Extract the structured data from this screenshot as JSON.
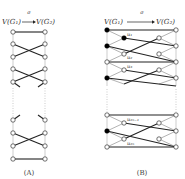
{
  "diagram_a": {
    "caption": "(A)",
    "map_label": "σ",
    "source_label": "V(G₁)",
    "target_label": "V(G₂)"
  },
  "diagram_b": {
    "caption": "(B)",
    "map_label": "σ",
    "source_label": "V(G₁)",
    "target_label": "V(G₂)",
    "edge_labels": [
      "u₁",
      "u₂",
      "u₃",
      "u₂ₙ₋₁",
      "u₂ₙ"
    ]
  },
  "colors": {
    "edge": "#222222",
    "thin_edge": "#777777",
    "node_fill_open": "#ffffff",
    "node_fill_filled": "#000000",
    "dotted": "#999999"
  }
}
